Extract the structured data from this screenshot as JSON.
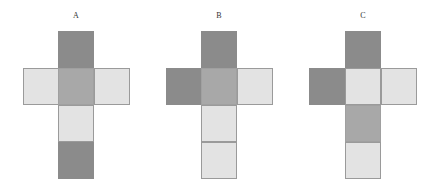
{
  "figure": {
    "nets": [
      {
        "label": "A",
        "label_x": 76,
        "cells": [
          {
            "x": 58,
            "y": 31,
            "shade": "dark"
          },
          {
            "x": 23,
            "y": 68,
            "shade": "light"
          },
          {
            "x": 58,
            "y": 68,
            "shade": "medium"
          },
          {
            "x": 94,
            "y": 68,
            "shade": "light"
          },
          {
            "x": 58,
            "y": 105,
            "shade": "light"
          },
          {
            "x": 58,
            "y": 142,
            "shade": "dark"
          }
        ]
      },
      {
        "label": "B",
        "label_x": 219,
        "cells": [
          {
            "x": 201,
            "y": 31,
            "shade": "dark"
          },
          {
            "x": 166,
            "y": 68,
            "shade": "dark"
          },
          {
            "x": 201,
            "y": 68,
            "shade": "medium"
          },
          {
            "x": 237,
            "y": 68,
            "shade": "light"
          },
          {
            "x": 201,
            "y": 105,
            "shade": "light"
          },
          {
            "x": 201,
            "y": 142,
            "shade": "light"
          }
        ]
      },
      {
        "label": "C",
        "label_x": 363,
        "cells": [
          {
            "x": 345,
            "y": 31,
            "shade": "dark"
          },
          {
            "x": 309,
            "y": 68,
            "shade": "dark"
          },
          {
            "x": 345,
            "y": 68,
            "shade": "light"
          },
          {
            "x": 381,
            "y": 68,
            "shade": "light"
          },
          {
            "x": 345,
            "y": 105,
            "shade": "medium"
          },
          {
            "x": 345,
            "y": 142,
            "shade": "light"
          }
        ]
      }
    ],
    "colors": {
      "dark": "#8b8b8b",
      "medium": "#a8a8a8",
      "light": "#e3e3e3",
      "border": "#9c9c9c"
    }
  }
}
